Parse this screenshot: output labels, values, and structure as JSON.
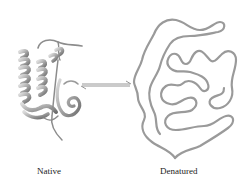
{
  "figure": {
    "type": "protein-folding-equilibrium",
    "states": [
      {
        "id": "native",
        "label": "Native"
      },
      {
        "id": "denatured",
        "label": "Denatured"
      }
    ],
    "arrow": {
      "kind": "equilibrium-harpoon",
      "from": "native",
      "to": "denatured"
    },
    "colors": {
      "background": "#ffffff",
      "ribbon_dark": "#6e6e6e",
      "ribbon_mid": "#a8a8a8",
      "ribbon_light": "#dcdcdc",
      "coil": "#9a9a9a",
      "arrow": "#8a8a8a",
      "text": "#222222"
    }
  }
}
